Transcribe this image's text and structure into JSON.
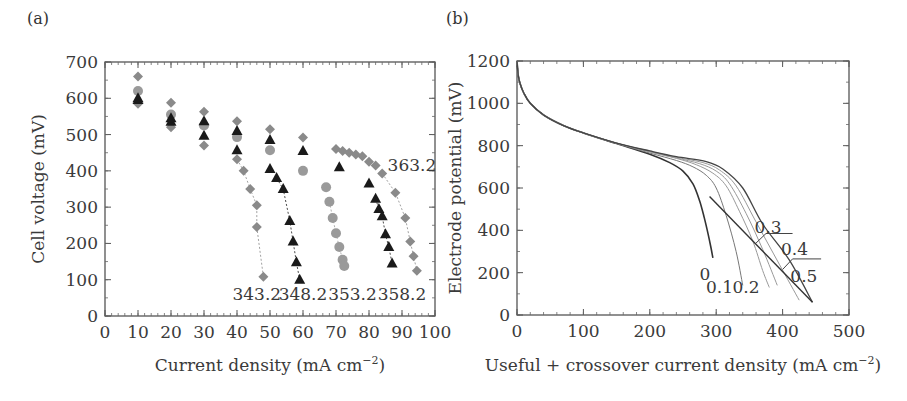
{
  "chart_data": [
    {
      "panel": "(a)",
      "type": "scatter",
      "title": "",
      "xlabel": "Current density (mA cm−2)",
      "ylabel": "Cell voltage (mV)",
      "xlim": [
        0,
        100
      ],
      "ylim": [
        0,
        700
      ],
      "xticks": [
        0,
        10,
        20,
        30,
        40,
        50,
        60,
        70,
        80,
        90,
        100
      ],
      "yticks": [
        0,
        100,
        200,
        300,
        400,
        500,
        600,
        700
      ],
      "grid": false,
      "series": [
        {
          "name": "343.2",
          "marker": "diamond",
          "color": "#8a8a8a",
          "x": [
            10,
            20,
            30,
            40,
            42,
            44,
            46,
            46,
            48
          ],
          "y": [
            585,
            520,
            470,
            432,
            400,
            350,
            305,
            245,
            108
          ]
        },
        {
          "name": "348.2",
          "marker": "triangle",
          "color": "#1a1a1a",
          "x": [
            10,
            20,
            30,
            40,
            50,
            52,
            54,
            56,
            57,
            58,
            59
          ],
          "y": [
            595,
            535,
            497,
            457,
            405,
            380,
            350,
            262,
            205,
            148,
            100
          ]
        },
        {
          "name": "353.2",
          "marker": "circle",
          "color": "#9a9a9a",
          "x": [
            10,
            20,
            30,
            40,
            50,
            60,
            67,
            68,
            69,
            70,
            71,
            72,
            72.5
          ],
          "y": [
            620,
            555,
            525,
            493,
            457,
            400,
            355,
            315,
            270,
            228,
            190,
            155,
            138
          ]
        },
        {
          "name": "358.2",
          "marker": "triangle",
          "color": "#1a1a1a",
          "x": [
            10,
            20,
            30,
            40,
            50,
            60,
            71,
            80,
            82,
            83,
            84,
            85,
            86,
            87
          ],
          "y": [
            600,
            545,
            537,
            510,
            485,
            455,
            410,
            365,
            323,
            295,
            275,
            225,
            190,
            145
          ]
        },
        {
          "name": "363.2",
          "marker": "diamond",
          "color": "#8a8a8a",
          "x": [
            10,
            20,
            30,
            40,
            50,
            60,
            70,
            72,
            74,
            76,
            78,
            80,
            82,
            84,
            88,
            91,
            92.5,
            93.5,
            94.5
          ],
          "y": [
            660,
            588,
            563,
            537,
            515,
            492,
            460,
            455,
            450,
            445,
            440,
            425,
            415,
            393,
            340,
            270,
            205,
            165,
            125
          ]
        }
      ],
      "annotations": [
        {
          "text": "343.2",
          "x": 46,
          "y": 60
        },
        {
          "text": "348.2",
          "x": 60,
          "y": 60
        },
        {
          "text": "353.2",
          "x": 75,
          "y": 60
        },
        {
          "text": "358.2",
          "x": 90,
          "y": 60
        },
        {
          "text": "363.2",
          "x": 93,
          "y": 415
        }
      ]
    },
    {
      "panel": "(b)",
      "type": "line",
      "title": "",
      "xlabel": "Useful + crossover current density (mA cm−2)",
      "ylabel": "Electrode potential (mV)",
      "xlim": [
        0,
        500
      ],
      "ylim": [
        0,
        1200
      ],
      "xticks": [
        0,
        100,
        200,
        300,
        400,
        500
      ],
      "yticks": [
        0,
        200,
        400,
        600,
        800,
        1000,
        1200
      ],
      "grid": false,
      "series": [
        {
          "name": "0",
          "color": "#333333",
          "width": 1.6,
          "x": [
            0,
            2,
            5,
            10,
            20,
            40,
            70,
            100,
            150,
            200,
            230,
            250,
            265,
            275,
            282,
            288,
            292,
            295
          ],
          "y": [
            1200,
            1130,
            1090,
            1050,
            1000,
            945,
            895,
            860,
            810,
            760,
            720,
            680,
            620,
            540,
            460,
            380,
            320,
            270
          ]
        },
        {
          "name": "0.1",
          "color": "#777777",
          "width": 1.0,
          "x": [
            0,
            2,
            5,
            10,
            20,
            40,
            70,
            100,
            150,
            200,
            240,
            265,
            285,
            300,
            315,
            330,
            340
          ],
          "y": [
            1200,
            1130,
            1090,
            1050,
            1000,
            945,
            895,
            860,
            810,
            765,
            730,
            700,
            660,
            600,
            470,
            300,
            140
          ]
        },
        {
          "name": "0.2",
          "color": "#999999",
          "width": 1.0,
          "x": [
            0,
            2,
            5,
            10,
            20,
            40,
            70,
            100,
            150,
            200,
            240,
            270,
            295,
            315,
            335,
            355,
            370,
            380
          ],
          "y": [
            1200,
            1130,
            1090,
            1050,
            1000,
            945,
            895,
            860,
            812,
            770,
            740,
            710,
            670,
            610,
            490,
            350,
            210,
            130
          ]
        },
        {
          "name": "0.3",
          "color": "#999999",
          "width": 1.0,
          "x": [
            0,
            2,
            5,
            10,
            20,
            40,
            70,
            100,
            150,
            200,
            240,
            275,
            300,
            320,
            345,
            370,
            392
          ],
          "y": [
            1200,
            1130,
            1090,
            1050,
            1000,
            945,
            895,
            860,
            812,
            772,
            742,
            715,
            680,
            620,
            480,
            310,
            140
          ]
        },
        {
          "name": "0.4",
          "color": "#999999",
          "width": 1.0,
          "x": [
            0,
            2,
            5,
            10,
            20,
            40,
            70,
            100,
            150,
            200,
            240,
            280,
            305,
            330,
            360,
            395,
            425
          ],
          "y": [
            1200,
            1130,
            1090,
            1050,
            1000,
            945,
            895,
            860,
            812,
            774,
            745,
            720,
            685,
            610,
            440,
            240,
            70
          ]
        },
        {
          "name": "0.5",
          "color": "#444444",
          "width": 1.3,
          "x": [
            0,
            2,
            5,
            10,
            20,
            40,
            70,
            100,
            150,
            200,
            240,
            285,
            310,
            340,
            370,
            410,
            445
          ],
          "y": [
            1200,
            1130,
            1090,
            1050,
            1000,
            945,
            895,
            860,
            812,
            775,
            748,
            725,
            690,
            600,
            430,
            260,
            60
          ]
        }
      ],
      "extra_lines": [
        {
          "name": "envelope",
          "color": "#333333",
          "x": [
            290,
            445
          ],
          "y": [
            560,
            60
          ]
        }
      ],
      "annotations": [
        {
          "text": "0",
          "x": 283,
          "y": 195,
          "leader": null
        },
        {
          "text": "0.1",
          "x": 305,
          "y": 130,
          "leader": null
        },
        {
          "text": "0.2",
          "x": 345,
          "y": 130,
          "leader": null
        },
        {
          "text": "0.3",
          "x": 378,
          "y": 415,
          "leader": {
            "x": [
              360,
              375,
              415
            ],
            "y": [
              340,
              385,
              385
            ]
          }
        },
        {
          "text": "0.4",
          "x": 418,
          "y": 310,
          "leader": {
            "x": [
              400,
              415,
              458
            ],
            "y": [
              215,
              265,
              265
            ]
          }
        },
        {
          "text": "0.5",
          "x": 432,
          "y": 185,
          "leader": null
        }
      ]
    }
  ],
  "labels": {
    "panel_a": "(a)",
    "panel_b": "(b)",
    "a_xlabel_main": "Current density (mA cm",
    "a_xlabel_sup": "−2",
    "a_xlabel_end": ")",
    "a_ylabel": "Cell voltage (mV)",
    "b_xlabel_main": "Useful + crossover current density (mA cm",
    "b_xlabel_sup": "−2",
    "b_xlabel_end": ")",
    "b_ylabel": "Electrode potential (mV)"
  }
}
